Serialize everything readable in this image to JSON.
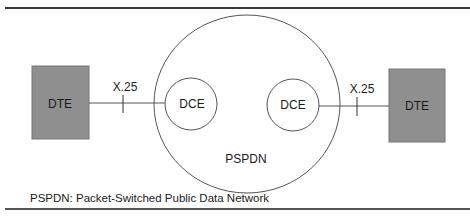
{
  "diagram": {
    "network": {
      "label": "PSPDN"
    },
    "nodes": [
      {
        "id": "dte-left",
        "label": "DTE",
        "shape": "rectangle",
        "fill": "#8f8f8f"
      },
      {
        "id": "dce-left",
        "label": "DCE",
        "shape": "circle"
      },
      {
        "id": "dce-right",
        "label": "DCE",
        "shape": "circle"
      },
      {
        "id": "dte-right",
        "label": "DTE",
        "shape": "rectangle",
        "fill": "#8f8f8f"
      }
    ],
    "links": [
      {
        "from": "dte-left",
        "to": "dce-left",
        "label": "X.25"
      },
      {
        "from": "dce-right",
        "to": "dte-right",
        "label": "X.25"
      }
    ],
    "caption": "PSPDN: Packet-Switched Public Data Network"
  },
  "colors": {
    "dte_fill": "#8f8f8f",
    "line": "#4a4a4a",
    "rule": "#3a3a3a"
  }
}
